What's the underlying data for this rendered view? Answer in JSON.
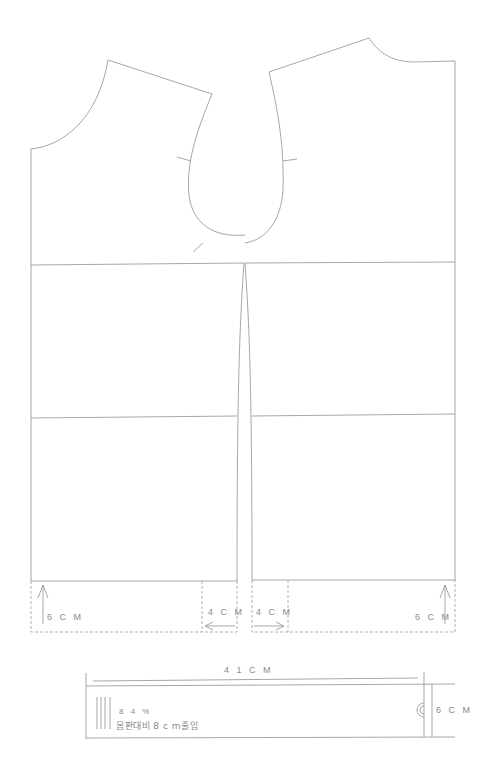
{
  "diagram": {
    "pieces": {
      "left_bodice": {
        "name": "back-bodice"
      },
      "right_bodice": {
        "name": "front-bodice"
      }
    },
    "extension_labels": {
      "left_hem_height": "6 C M",
      "left_center_width": "4 C M",
      "right_center_width": "4 C M",
      "right_hem_height": "6 C M"
    },
    "waistband": {
      "length_label": "4 1 C M",
      "height_label": "6 C M",
      "note_percent": "8 4 %",
      "note_reduction": "몸판대비  8 c m줄임"
    },
    "colors": {
      "line": "#9c9c9c",
      "text": "#8a8a8a",
      "background": "#ffffff"
    }
  }
}
